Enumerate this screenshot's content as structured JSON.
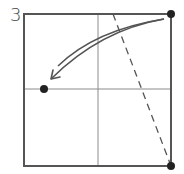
{
  "step": {
    "number": "3"
  },
  "diagram": {
    "type": "folding-instruction",
    "colors": {
      "frame": "#555555",
      "crease": "#8a8a8a",
      "dash": "#555555",
      "arrow": "#555555",
      "dot": "#222222",
      "background": "#ffffff"
    },
    "elements": [
      {
        "name": "paper-square",
        "kind": "square-outline"
      },
      {
        "name": "vertical-crease",
        "kind": "crease-line"
      },
      {
        "name": "horizontal-crease",
        "kind": "crease-line"
      },
      {
        "name": "fold-line",
        "kind": "dashed-line"
      },
      {
        "name": "fold-arrow",
        "kind": "curved-arrow"
      },
      {
        "name": "target-dot",
        "kind": "point"
      },
      {
        "name": "top-right-corner-dot",
        "kind": "point"
      },
      {
        "name": "bottom-right-corner-dot",
        "kind": "point"
      }
    ]
  }
}
